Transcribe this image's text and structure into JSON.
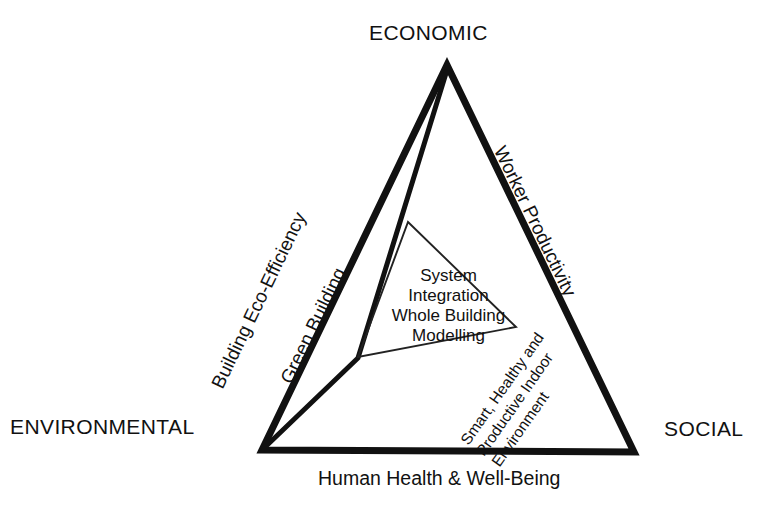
{
  "diagram": {
    "type": "triangle-concept-diagram",
    "title_present": false,
    "colors": {
      "stroke": "#111111",
      "background": "#ffffff",
      "inner_stroke": "#222222"
    },
    "vertices": {
      "top": "ECONOMIC",
      "bottom_left": "ENVIRONMENTAL",
      "bottom_right": "SOCIAL"
    },
    "edges": {
      "left_outer": "Building Eco-Efficiency",
      "left_inner": "Green Building",
      "right_outer": "Worker Productivity",
      "bottom": "Human Health & Well-Being",
      "inner_right_diagonal_line1": "Smart, Healthy and",
      "inner_right_diagonal_line2": "Productive Indoor",
      "inner_right_diagonal_line3": "Environment"
    },
    "center": {
      "line1": "System",
      "line2": "Integration",
      "line3": "Whole Building",
      "line4": "Modelling"
    },
    "geometry": {
      "outer_triangle_points": "447,65 262,450 634,452",
      "green_building_line": "447,70 358,358 262,450",
      "inner_triangle_points": "408,222 516,327 358,357"
    }
  }
}
